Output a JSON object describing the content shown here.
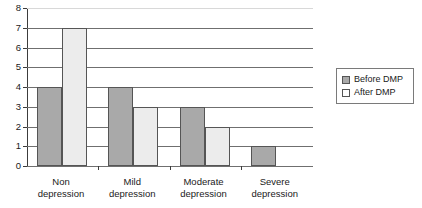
{
  "chart_data": {
    "type": "bar",
    "title": "",
    "subtitle": "",
    "xlabel": "",
    "ylabel": "",
    "ylim": [
      0,
      8
    ],
    "yticks": [
      0,
      1,
      2,
      3,
      4,
      5,
      6,
      7,
      8
    ],
    "grid": true,
    "legend_position": "right",
    "categories": [
      "Non depression",
      "Mild depression",
      "Moderate depression",
      "Severe depression"
    ],
    "category_lines": [
      [
        "Non",
        "depression"
      ],
      [
        "Mild",
        "depression"
      ],
      [
        "Moderate",
        "depression"
      ],
      [
        "Severe",
        "depression"
      ]
    ],
    "series": [
      {
        "name": "Before DMP",
        "color": "#a9a9a9",
        "values": [
          4,
          4,
          3,
          1
        ]
      },
      {
        "name": "After DMP",
        "color": "#ececec",
        "values": [
          7,
          3,
          2,
          0
        ]
      }
    ]
  },
  "legend": {
    "entries": [
      {
        "label": "Before DMP",
        "swatch": "filled-gray-square-icon"
      },
      {
        "label": "After DMP",
        "swatch": "empty-white-square-icon"
      }
    ]
  },
  "axis": {
    "y_tick_labels": [
      "0",
      "1",
      "2",
      "3",
      "4",
      "5",
      "6",
      "7",
      "8"
    ]
  }
}
